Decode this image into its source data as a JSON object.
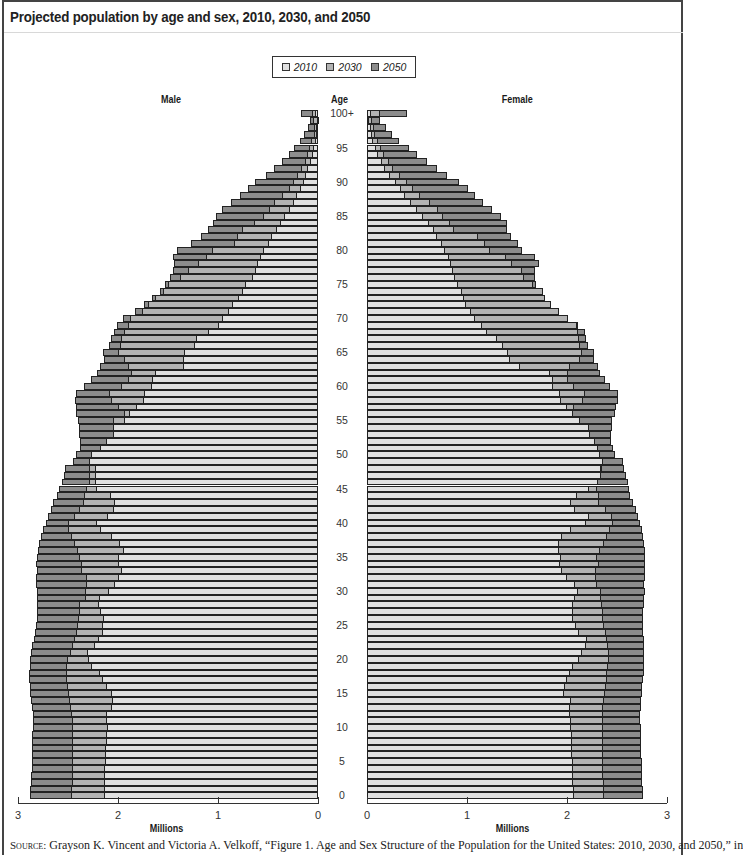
{
  "title": "Projected population by age and sex, 2010, 2030, and 2050",
  "legend": [
    {
      "label": "2010",
      "color": "#e0e0e0"
    },
    {
      "label": "2030",
      "color": "#b3b3b3"
    },
    {
      "label": "2050",
      "color": "#8c8c8c"
    }
  ],
  "labels": {
    "male": "Male",
    "female": "Female",
    "age": "Age",
    "x_unit_left": "Millions",
    "x_unit_right": "Millions"
  },
  "age_ticks": [
    "100+",
    "95",
    "90",
    "85",
    "80",
    "75",
    "70",
    "65",
    "60",
    "55",
    "50",
    "45",
    "40",
    "35",
    "30",
    "25",
    "20",
    "15",
    "10",
    "5",
    "0"
  ],
  "x_ticks_male": [
    "3",
    "2",
    "1",
    "0"
  ],
  "x_ticks_female": [
    "0",
    "1",
    "2",
    "3"
  ],
  "source": {
    "prefix": "Source:",
    "text": " Grayson K. Vincent and Victoria A. Velkoff, “Figure 1. Age and Sex Structure of the Population for the United States: 2010, 2030, and 2050,” in"
  },
  "chart_data": {
    "type": "bar",
    "subtype": "population-pyramid",
    "title": "Projected population by age and sex, 2010, 2030, and 2050",
    "xlabel": "Millions",
    "ylabel": "Age",
    "xlim": [
      0,
      3
    ],
    "x_ticks": [
      0,
      1,
      2,
      3
    ],
    "legend_position": "top-center",
    "grid": false,
    "categories_note": "Single years of age 0 to 99, plus 100+ (index 100)",
    "categories": [
      "0",
      "1",
      "2",
      "3",
      "4",
      "5",
      "6",
      "7",
      "8",
      "9",
      "10",
      "11",
      "12",
      "13",
      "14",
      "15",
      "16",
      "17",
      "18",
      "19",
      "20",
      "21",
      "22",
      "23",
      "24",
      "25",
      "26",
      "27",
      "28",
      "29",
      "30",
      "31",
      "32",
      "33",
      "34",
      "35",
      "36",
      "37",
      "38",
      "39",
      "40",
      "41",
      "42",
      "43",
      "44",
      "45",
      "46",
      "47",
      "48",
      "49",
      "50",
      "51",
      "52",
      "53",
      "54",
      "55",
      "56",
      "57",
      "58",
      "59",
      "60",
      "61",
      "62",
      "63",
      "64",
      "65",
      "66",
      "67",
      "68",
      "69",
      "70",
      "71",
      "72",
      "73",
      "74",
      "75",
      "76",
      "77",
      "78",
      "79",
      "80",
      "81",
      "82",
      "83",
      "84",
      "85",
      "86",
      "87",
      "88",
      "89",
      "90",
      "91",
      "92",
      "93",
      "94",
      "95",
      "96",
      "97",
      "98",
      "99",
      "100+"
    ],
    "series": [
      {
        "name": "Male 2010",
        "sex": "Male",
        "year": "2010",
        "values": [
          2.14,
          2.14,
          2.14,
          2.14,
          2.14,
          2.13,
          2.13,
          2.13,
          2.12,
          2.12,
          2.11,
          2.12,
          2.12,
          2.07,
          2.06,
          2.07,
          2.12,
          2.16,
          2.19,
          2.27,
          2.3,
          2.31,
          2.24,
          2.2,
          2.16,
          2.16,
          2.15,
          2.18,
          2.2,
          2.19,
          2.1,
          2.04,
          2.0,
          1.97,
          2.0,
          2.0,
          1.95,
          1.99,
          2.07,
          2.18,
          2.22,
          2.11,
          2.05,
          2.04,
          2.08,
          2.22,
          2.23,
          2.23,
          2.23,
          2.29,
          2.27,
          2.18,
          2.12,
          2.05,
          2.05,
          1.94,
          1.89,
          1.82,
          1.75,
          1.74,
          1.67,
          1.66,
          1.63,
          1.35,
          1.35,
          1.34,
          1.24,
          1.22,
          1.1,
          1.0,
          0.96,
          0.9,
          0.86,
          0.8,
          0.76,
          0.73,
          0.66,
          0.63,
          0.61,
          0.58,
          0.55,
          0.5,
          0.47,
          0.42,
          0.38,
          0.34,
          0.29,
          0.25,
          0.22,
          0.18,
          0.15,
          0.13,
          0.11,
          0.08,
          0.06,
          0.05,
          0.03,
          0.02,
          0.02,
          0.01,
          0.03
        ]
      },
      {
        "name": "Male 2030",
        "sex": "Male",
        "year": "2030",
        "values": [
          2.47,
          2.47,
          2.46,
          2.46,
          2.46,
          2.46,
          2.46,
          2.46,
          2.46,
          2.46,
          2.46,
          2.46,
          2.47,
          2.48,
          2.49,
          2.5,
          2.51,
          2.52,
          2.52,
          2.52,
          2.51,
          2.48,
          2.46,
          2.44,
          2.42,
          2.41,
          2.4,
          2.39,
          2.39,
          2.33,
          2.33,
          2.32,
          2.32,
          2.37,
          2.37,
          2.39,
          2.41,
          2.44,
          2.47,
          2.5,
          2.5,
          2.44,
          2.39,
          2.35,
          2.34,
          2.32,
          2.29,
          2.29,
          2.29,
          2.29,
          2.27,
          2.18,
          2.12,
          2.05,
          2.05,
          2.05,
          1.94,
          2.0,
          2.07,
          2.09,
          1.97,
          1.9,
          1.87,
          1.9,
          1.94,
          2.0,
          1.98,
          1.97,
          1.94,
          1.9,
          1.88,
          1.76,
          1.7,
          1.63,
          1.55,
          1.5,
          1.38,
          1.3,
          1.2,
          1.12,
          1.06,
          0.84,
          0.81,
          0.76,
          0.64,
          0.55,
          0.49,
          0.44,
          0.36,
          0.29,
          0.25,
          0.21,
          0.17,
          0.13,
          0.11,
          0.09,
          0.07,
          0.04,
          0.04,
          0.05,
          0.06
        ]
      },
      {
        "name": "Male 2050",
        "sex": "Male",
        "year": "2050",
        "values": [
          2.88,
          2.88,
          2.87,
          2.87,
          2.86,
          2.86,
          2.86,
          2.86,
          2.86,
          2.86,
          2.85,
          2.85,
          2.85,
          2.86,
          2.87,
          2.88,
          2.88,
          2.89,
          2.89,
          2.88,
          2.88,
          2.87,
          2.86,
          2.84,
          2.83,
          2.82,
          2.81,
          2.81,
          2.81,
          2.81,
          2.81,
          2.82,
          2.82,
          2.81,
          2.82,
          2.81,
          2.8,
          2.79,
          2.77,
          2.75,
          2.72,
          2.7,
          2.67,
          2.65,
          2.61,
          2.59,
          2.56,
          2.54,
          2.53,
          2.45,
          2.42,
          2.38,
          2.38,
          2.39,
          2.39,
          2.4,
          2.42,
          2.42,
          2.43,
          2.42,
          2.34,
          2.27,
          2.21,
          2.18,
          2.14,
          2.15,
          2.09,
          2.07,
          2.04,
          2.01,
          1.95,
          1.83,
          1.74,
          1.66,
          1.58,
          1.53,
          1.48,
          1.45,
          1.44,
          1.45,
          1.41,
          1.27,
          1.17,
          1.1,
          1.05,
          1.02,
          0.96,
          0.87,
          0.78,
          0.7,
          0.63,
          0.52,
          0.44,
          0.36,
          0.29,
          0.24,
          0.18,
          0.14,
          0.1,
          0.08,
          0.17
        ]
      },
      {
        "name": "Female 2010",
        "sex": "Female",
        "year": "2010",
        "values": [
          2.07,
          2.07,
          2.06,
          2.06,
          2.06,
          2.06,
          2.05,
          2.05,
          2.05,
          2.05,
          2.04,
          2.04,
          2.03,
          2.03,
          2.04,
          1.97,
          1.98,
          2.0,
          2.03,
          2.06,
          2.12,
          2.15,
          2.19,
          2.2,
          2.12,
          2.09,
          2.06,
          2.06,
          2.06,
          2.08,
          2.11,
          2.08,
          2.0,
          1.95,
          1.93,
          1.94,
          1.92,
          1.92,
          1.95,
          2.04,
          2.19,
          2.22,
          2.08,
          2.04,
          2.1,
          2.22,
          2.31,
          2.34,
          2.34,
          2.36,
          2.33,
          2.31,
          2.28,
          2.23,
          2.22,
          2.13,
          2.06,
          2.0,
          1.94,
          1.93,
          1.86,
          1.86,
          1.83,
          1.53,
          1.43,
          1.41,
          1.36,
          1.3,
          1.2,
          1.15,
          1.08,
          1.04,
          0.99,
          0.97,
          0.95,
          0.91,
          0.88,
          0.86,
          0.84,
          0.82,
          0.78,
          0.75,
          0.7,
          0.67,
          0.62,
          0.56,
          0.5,
          0.44,
          0.38,
          0.34,
          0.29,
          0.23,
          0.18,
          0.15,
          0.11,
          0.09,
          0.06,
          0.05,
          0.04,
          0.02,
          0.04
        ]
      },
      {
        "name": "Female 2030",
        "sex": "Female",
        "year": "2030",
        "values": [
          2.37,
          2.37,
          2.37,
          2.36,
          2.36,
          2.36,
          2.36,
          2.36,
          2.36,
          2.36,
          2.36,
          2.36,
          2.36,
          2.36,
          2.37,
          2.38,
          2.39,
          2.4,
          2.4,
          2.41,
          2.42,
          2.42,
          2.41,
          2.4,
          2.39,
          2.37,
          2.36,
          2.36,
          2.35,
          2.34,
          2.34,
          2.3,
          2.29,
          2.29,
          2.32,
          2.3,
          2.33,
          2.37,
          2.4,
          2.43,
          2.46,
          2.45,
          2.39,
          2.32,
          2.32,
          2.3,
          2.31,
          2.34,
          2.35,
          2.36,
          2.33,
          2.31,
          2.28,
          2.23,
          2.22,
          2.13,
          2.06,
          2.07,
          2.16,
          2.18,
          2.07,
          2.01,
          2.01,
          2.03,
          2.13,
          2.15,
          2.13,
          2.12,
          2.11,
          2.1,
          2.01,
          1.92,
          1.84,
          1.78,
          1.76,
          1.66,
          1.57,
          1.55,
          1.45,
          1.39,
          1.23,
          1.18,
          1.11,
          0.87,
          0.83,
          0.76,
          0.71,
          0.63,
          0.53,
          0.46,
          0.4,
          0.33,
          0.26,
          0.22,
          0.17,
          0.14,
          0.11,
          0.08,
          0.07,
          0.05,
          0.13
        ]
      },
      {
        "name": "Female 2050",
        "sex": "Female",
        "year": "2050",
        "values": [
          2.76,
          2.76,
          2.75,
          2.75,
          2.75,
          2.75,
          2.74,
          2.74,
          2.74,
          2.74,
          2.74,
          2.73,
          2.73,
          2.74,
          2.74,
          2.75,
          2.75,
          2.76,
          2.77,
          2.77,
          2.77,
          2.77,
          2.77,
          2.77,
          2.76,
          2.76,
          2.76,
          2.76,
          2.77,
          2.77,
          2.78,
          2.77,
          2.78,
          2.78,
          2.78,
          2.78,
          2.78,
          2.77,
          2.76,
          2.75,
          2.73,
          2.71,
          2.69,
          2.66,
          2.63,
          2.62,
          2.61,
          2.59,
          2.57,
          2.56,
          2.48,
          2.46,
          2.44,
          2.44,
          2.45,
          2.45,
          2.48,
          2.49,
          2.51,
          2.51,
          2.43,
          2.38,
          2.33,
          2.31,
          2.27,
          2.27,
          2.21,
          2.19,
          2.18,
          2.11,
          2.01,
          1.92,
          1.84,
          1.78,
          1.76,
          1.69,
          1.68,
          1.68,
          1.72,
          1.68,
          1.55,
          1.51,
          1.44,
          1.4,
          1.4,
          1.34,
          1.25,
          1.16,
          1.08,
          1.01,
          0.92,
          0.8,
          0.7,
          0.6,
          0.5,
          0.42,
          0.32,
          0.25,
          0.19,
          0.13,
          0.4
        ]
      }
    ]
  }
}
